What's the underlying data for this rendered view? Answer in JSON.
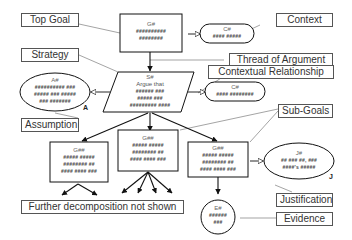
{
  "diagram": {
    "type": "Goal Structuring Notation",
    "labels": {
      "top_goal": "Top Goal",
      "context": "Context",
      "strategy": "Strategy",
      "thread_of_argument": "Thread of Argument",
      "contextual_relationship": "Contextual Relationship",
      "assumption": "Assumption",
      "sub_goals": "Sub-Goals",
      "justification": "Justification",
      "evidence": "Evidence",
      "further_decomposition": "Further decomposition not shown"
    },
    "nodes": {
      "top_goal": {
        "id": "G#",
        "lines": [
          "##########",
          "########"
        ]
      },
      "context_top": {
        "id": "C#",
        "lines": [
          "#### #####"
        ]
      },
      "strategy": {
        "id": "S#",
        "lines": [
          "Argue that",
          "###### ###",
          "##### ###",
          "######### ####"
        ]
      },
      "context_strategy": {
        "id": "C#",
        "lines": [
          "#### ########"
        ]
      },
      "assumption": {
        "id": "A#",
        "tag": "A",
        "lines": [
          "########## ###",
          "##### ### #####",
          "### #######"
        ]
      },
      "subgoal_left": {
        "id": "G##",
        "lines": [
          "##### #####",
          "######## ##",
          "#### #### ###"
        ]
      },
      "subgoal_mid": {
        "id": "G##",
        "lines": [
          "##### #####",
          "######## ##",
          "#### #### ###"
        ]
      },
      "subgoal_right": {
        "id": "G##",
        "lines": [
          "##### #####",
          "######## ##",
          "#### #### ###"
        ]
      },
      "justification": {
        "id": "J#",
        "tag": "J",
        "lines": [
          "## ### ##, ###",
          "####'s #####"
        ]
      },
      "evidence": {
        "id": "E#",
        "lines": [
          "######",
          "###"
        ]
      }
    }
  }
}
